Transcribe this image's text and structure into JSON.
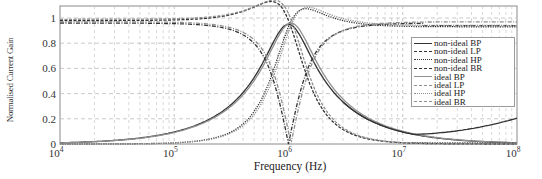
{
  "chart_data": {
    "type": "line",
    "title": "",
    "xlabel": "Frequency (Hz)",
    "ylabel": "Normalised Current Gain",
    "xscale": "log",
    "xlim": [
      10000,
      100000000
    ],
    "ylim": [
      0,
      1.05
    ],
    "x_ticks": [
      "10^4",
      "10^5",
      "10^6",
      "10^7",
      "10^8"
    ],
    "y_ticks": [
      "0",
      "0.2",
      "0.4",
      "0.6",
      "0.8",
      "1"
    ],
    "grid": true,
    "grid_style": "dashed",
    "legend_position": "upper right (inside)",
    "legend": [
      "non-ideal BP",
      "non-ideal LP",
      "non-ideal HP",
      "non-ideal BR",
      "ideal BP",
      "ideal LP",
      "ideal HP",
      "ideal BR"
    ],
    "center_frequency_hz": 1000000,
    "x": [
      10000,
      31623,
      100000,
      177828,
      316228,
      562341,
      1000000,
      1778279,
      3162278,
      5623413,
      10000000,
      31622777,
      100000000
    ],
    "series": [
      {
        "name": "non-ideal BP",
        "style": "solid",
        "values": [
          0.01,
          0.03,
          0.1,
          0.17,
          0.32,
          0.6,
          0.95,
          0.6,
          0.32,
          0.19,
          0.11,
          0.05,
          0.02
        ]
      },
      {
        "name": "non-ideal LP",
        "style": "dashed",
        "values": [
          0.98,
          0.98,
          0.97,
          0.95,
          0.88,
          0.7,
          0.45,
          0.24,
          0.1,
          0.04,
          0.02,
          0.01,
          0.0
        ]
      },
      {
        "name": "non-ideal HP",
        "style": "dotted",
        "values": [
          0.0,
          0.0,
          0.01,
          0.03,
          0.09,
          0.25,
          0.5,
          0.72,
          0.86,
          0.91,
          0.92,
          0.93,
          0.93
        ]
      },
      {
        "name": "non-ideal BR",
        "style": "dash-dot",
        "values": [
          0.98,
          0.98,
          0.97,
          0.95,
          0.88,
          0.6,
          0.0,
          0.6,
          0.86,
          0.92,
          0.94,
          0.94,
          0.94
        ]
      },
      {
        "name": "ideal BP",
        "style": "solid",
        "values": [
          0.01,
          0.03,
          0.1,
          0.18,
          0.32,
          0.61,
          0.96,
          0.61,
          0.32,
          0.18,
          0.1,
          0.03,
          0.01
        ]
      },
      {
        "name": "ideal LP",
        "style": "dashed",
        "values": [
          0.99,
          0.99,
          0.98,
          0.96,
          0.89,
          0.71,
          0.46,
          0.23,
          0.09,
          0.03,
          0.01,
          0.0,
          0.0
        ]
      },
      {
        "name": "ideal HP",
        "style": "dotted",
        "values": [
          0.0,
          0.0,
          0.01,
          0.03,
          0.09,
          0.24,
          0.48,
          0.72,
          0.87,
          0.92,
          0.93,
          0.93,
          0.93
        ]
      },
      {
        "name": "ideal BR",
        "style": "dash-dot",
        "values": [
          0.99,
          0.99,
          0.98,
          0.96,
          0.89,
          0.61,
          0.0,
          0.61,
          0.87,
          0.92,
          0.94,
          0.94,
          0.94
        ]
      }
    ],
    "extra_curves_note_values": {
      "lower_right_rising_curve": {
        "x": [
          10000000,
          31622777,
          100000000
        ],
        "values": [
          0.08,
          0.07,
          0.13
        ]
      }
    }
  },
  "labels": {
    "ylabel": "Normalised Current Gain",
    "xlabel": "Frequency (Hz)"
  },
  "colors": {
    "axis": "#8a8a8a",
    "grid": "#bdbdbd",
    "curve_dark": "#333333",
    "curve_light": "#8f8f8f"
  }
}
